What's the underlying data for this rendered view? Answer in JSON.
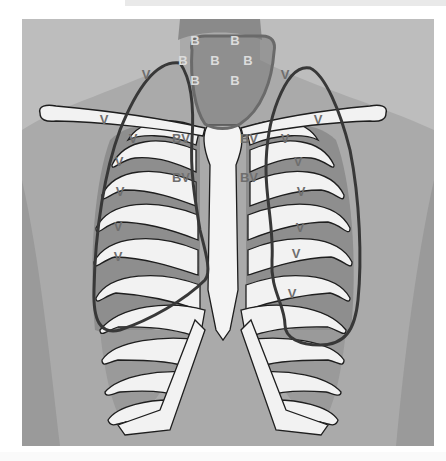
{
  "diagram": {
    "colors": {
      "background": "#ffffff",
      "skin": "#b9b9b9",
      "skin_dark": "#9d9d9d",
      "bronchial_zone_fill": "#8f8f8f",
      "bronchial_zone_stroke": "#6a6a6a",
      "lung_outline": "#3a3a3a",
      "bone": "#f2f2f2",
      "bone_outline": "#1e1e1e",
      "intercostal": "#8c8c8c"
    },
    "labels": {
      "B": [
        {
          "text": "B",
          "x": 195,
          "y": 42
        },
        {
          "text": "B",
          "x": 235,
          "y": 42
        },
        {
          "text": "B",
          "x": 183,
          "y": 62
        },
        {
          "text": "B",
          "x": 215,
          "y": 62
        },
        {
          "text": "B",
          "x": 248,
          "y": 62
        },
        {
          "text": "B",
          "x": 195,
          "y": 82
        },
        {
          "text": "B",
          "x": 235,
          "y": 82
        }
      ],
      "BV": [
        {
          "text": "BV",
          "x": 181,
          "y": 140
        },
        {
          "text": "BV",
          "x": 249,
          "y": 140
        },
        {
          "text": "BV",
          "x": 181,
          "y": 179
        },
        {
          "text": "BV",
          "x": 249,
          "y": 179
        }
      ],
      "V": [
        {
          "text": "V",
          "x": 146,
          "y": 76
        },
        {
          "text": "V",
          "x": 285,
          "y": 76
        },
        {
          "text": "V",
          "x": 104,
          "y": 121
        },
        {
          "text": "V",
          "x": 318,
          "y": 121
        },
        {
          "text": "V",
          "x": 133,
          "y": 140
        },
        {
          "text": "V",
          "x": 285,
          "y": 140
        },
        {
          "text": "V",
          "x": 119,
          "y": 163
        },
        {
          "text": "V",
          "x": 298,
          "y": 163
        },
        {
          "text": "V",
          "x": 120,
          "y": 193
        },
        {
          "text": "V",
          "x": 301,
          "y": 193
        },
        {
          "text": "V",
          "x": 118,
          "y": 228
        },
        {
          "text": "V",
          "x": 300,
          "y": 229
        },
        {
          "text": "V",
          "x": 118,
          "y": 258
        },
        {
          "text": "V",
          "x": 296,
          "y": 255
        },
        {
          "text": "V",
          "x": 292,
          "y": 295
        }
      ]
    }
  }
}
